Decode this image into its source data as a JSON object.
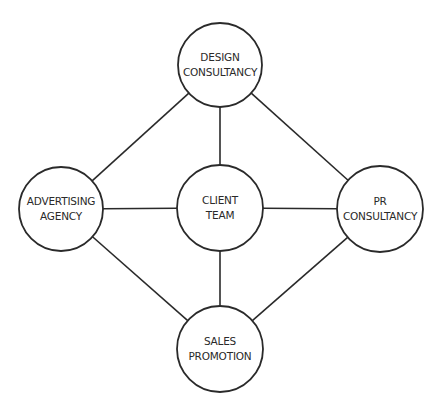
{
  "diagram": {
    "type": "network",
    "stroke_color": "#2a2a2a",
    "background": "#ffffff",
    "nodes": [
      {
        "id": "design",
        "line1": "DESIGN",
        "line2": "CONSULTANCY",
        "cx": 220,
        "cy": 65,
        "r": 42
      },
      {
        "id": "advertising",
        "line1": "ADVERTISING",
        "line2": "AGENCY",
        "cx": 61,
        "cy": 209,
        "r": 42
      },
      {
        "id": "client",
        "line1": "CLIENT",
        "line2": "TEAM",
        "cx": 220,
        "cy": 208,
        "r": 43
      },
      {
        "id": "pr",
        "line1": "PR",
        "line2": "CONSULTANCY",
        "cx": 380,
        "cy": 209,
        "r": 43
      },
      {
        "id": "sales",
        "line1": "SALES",
        "line2": "PROMOTION",
        "cx": 220,
        "cy": 349,
        "r": 43
      }
    ],
    "edges": [
      [
        "design",
        "client"
      ],
      [
        "design",
        "advertising"
      ],
      [
        "design",
        "pr"
      ],
      [
        "advertising",
        "client"
      ],
      [
        "client",
        "pr"
      ],
      [
        "client",
        "sales"
      ],
      [
        "advertising",
        "sales"
      ],
      [
        "pr",
        "sales"
      ]
    ]
  }
}
